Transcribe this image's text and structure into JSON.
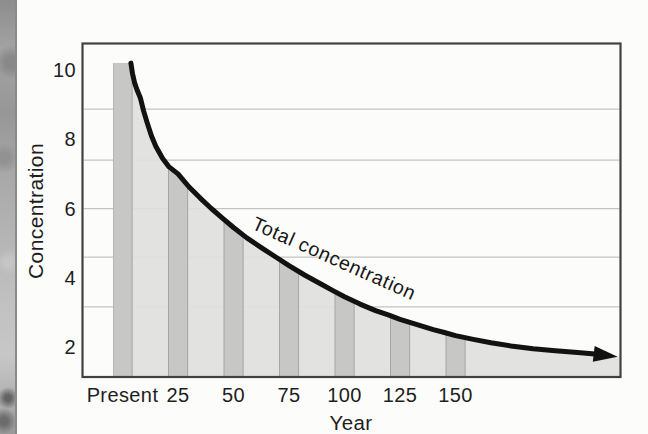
{
  "figure_caption": "",
  "chart_data": {
    "type": "area",
    "title": "",
    "xlabel": "Year",
    "ylabel": "Concentration",
    "curve_annotation": "Total concentration",
    "x_tick_labels": [
      "Present",
      "25",
      "50",
      "75",
      "100",
      "125",
      "150"
    ],
    "x_tick_years": [
      0,
      25,
      50,
      75,
      100,
      125,
      150
    ],
    "y_ticks": [
      2,
      4,
      6,
      8,
      10
    ],
    "xlim_years": [
      -18,
      225
    ],
    "ylim": [
      1.13,
      10.95
    ],
    "grid": "horizontal, unlabeled, 5 faint lines",
    "gridline_values": [
      8.87,
      7.4,
      6.0,
      4.6,
      3.16
    ],
    "bars": {
      "years": [
        0,
        25,
        50,
        75,
        100,
        125,
        150
      ],
      "values": [
        10.2,
        7.0,
        5.45,
        4.35,
        3.45,
        2.8,
        2.33
      ],
      "bar_width_years": 8.6
    },
    "curve_year_value": [
      [
        3.8,
        10.2
      ],
      [
        4.5,
        9.9
      ],
      [
        5.5,
        9.62
      ],
      [
        6.7,
        9.4
      ],
      [
        8,
        9.2
      ],
      [
        9.5,
        8.82
      ],
      [
        11,
        8.5
      ],
      [
        13,
        8.1
      ],
      [
        15,
        7.8
      ],
      [
        18,
        7.45
      ],
      [
        21,
        7.2
      ],
      [
        25,
        7.0
      ],
      [
        30,
        6.62
      ],
      [
        35,
        6.3
      ],
      [
        40,
        6.0
      ],
      [
        45,
        5.72
      ],
      [
        50,
        5.45
      ],
      [
        56,
        5.15
      ],
      [
        63,
        4.85
      ],
      [
        69,
        4.6
      ],
      [
        75,
        4.35
      ],
      [
        82,
        4.08
      ],
      [
        90,
        3.8
      ],
      [
        95,
        3.62
      ],
      [
        100,
        3.45
      ],
      [
        107,
        3.24
      ],
      [
        114,
        3.05
      ],
      [
        120,
        2.92
      ],
      [
        125,
        2.8
      ],
      [
        132,
        2.66
      ],
      [
        140,
        2.5
      ],
      [
        145,
        2.42
      ],
      [
        150,
        2.33
      ],
      [
        158,
        2.22
      ],
      [
        166,
        2.12
      ],
      [
        175,
        2.03
      ],
      [
        185,
        1.95
      ],
      [
        195,
        1.89
      ],
      [
        205,
        1.84
      ],
      [
        214,
        1.79
      ],
      [
        223,
        1.72
      ]
    ],
    "curve_ends_in_arrow": true,
    "legend_position": "none",
    "colors": {
      "area_fill": "#e0e0dd",
      "bar_fill": "#c7c7c5",
      "bar_edge": "#a6a6a6",
      "curve": "#121212",
      "frame": "#414141",
      "gridline": "#c3c3c3",
      "text": "#1e1e1e"
    }
  }
}
